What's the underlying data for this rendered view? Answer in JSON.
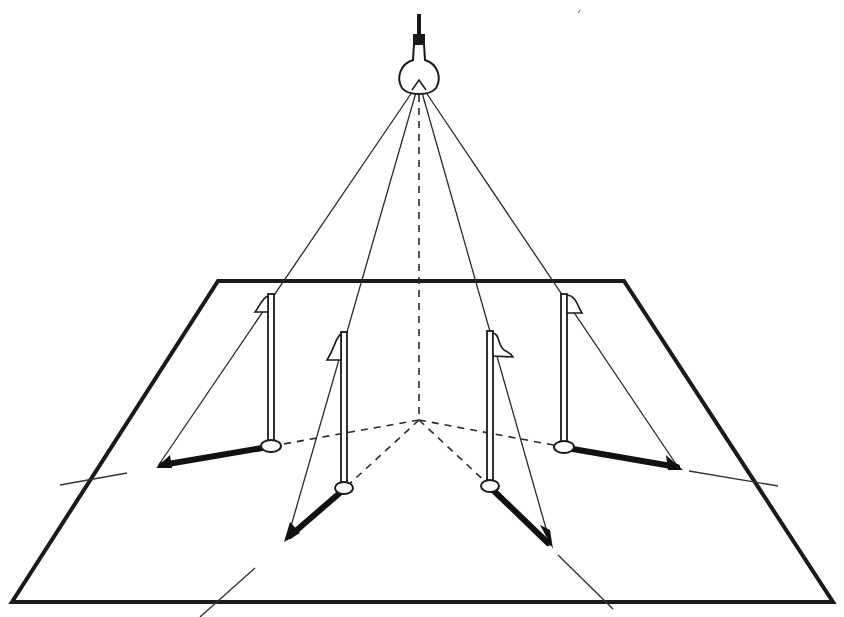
{
  "diagram": {
    "title": "",
    "colors": {
      "ink": "#1a1a1a",
      "background": "#ffffff"
    },
    "elements": {
      "light_source": {
        "label": "",
        "icon": "light-bulb-icon"
      },
      "plane": {
        "label": ""
      },
      "poles": [
        {
          "id": "pole-back-left",
          "label": ""
        },
        {
          "id": "pole-front-left",
          "label": ""
        },
        {
          "id": "pole-front-right",
          "label": ""
        },
        {
          "id": "pole-back-right",
          "label": ""
        }
      ],
      "foot_point": {
        "label": ""
      }
    },
    "text_labels": []
  }
}
